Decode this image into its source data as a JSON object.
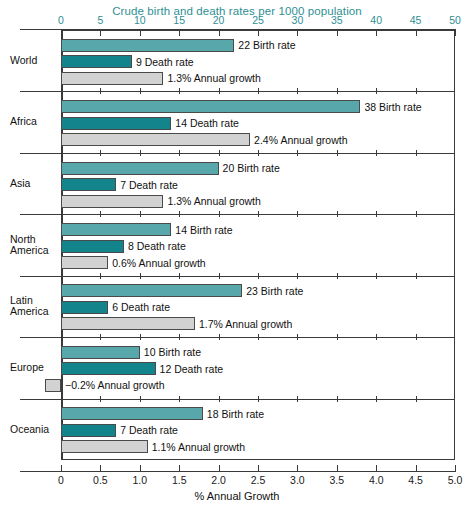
{
  "chart_data": {
    "type": "bar",
    "orientation": "horizontal",
    "title": "Crude birth and death rates per 1000 population",
    "xlabel_top": "Crude birth and death rates per 1000 population",
    "xlabel_bottom": "% Annual Growth",
    "ylabel": "",
    "grid": false,
    "legend_position": "inline-labels",
    "top_axis": {
      "label": "Crude birth and death rates per 1000 population",
      "min": 0,
      "max": 50,
      "step": 5,
      "ticks": [
        0,
        5,
        10,
        15,
        20,
        25,
        30,
        35,
        40,
        45,
        50
      ],
      "tick_labels": [
        "0",
        "5",
        "10",
        "15",
        "20",
        "25",
        "30",
        "35",
        "40",
        "45",
        "50"
      ],
      "color": "#2e8f94"
    },
    "bottom_axis": {
      "label": "% Annual Growth",
      "min": 0,
      "max": 5.0,
      "step": 0.5,
      "ticks": [
        0,
        0.5,
        1.0,
        1.5,
        2.0,
        2.5,
        3.0,
        3.5,
        4.0,
        4.5,
        5.0
      ],
      "tick_labels": [
        "0",
        "0.5",
        "1.0",
        "1.5",
        "2.0",
        "2.5",
        "3.0",
        "3.5",
        "4.0",
        "4.5",
        "5.0"
      ],
      "color": "#1a1a1a"
    },
    "categories": [
      "World",
      "Africa",
      "Asia",
      "North America",
      "Latin America",
      "Europe",
      "Oceania"
    ],
    "series": [
      {
        "name": "Birth rate",
        "axis": "top",
        "color": "#58a8ab",
        "values": [
          22,
          38,
          20,
          14,
          23,
          10,
          18
        ]
      },
      {
        "name": "Death rate",
        "axis": "top",
        "color": "#14848c",
        "values": [
          9,
          14,
          7,
          8,
          6,
          12,
          7
        ]
      },
      {
        "name": "Annual growth",
        "axis": "bottom",
        "color": "#d2d2d2",
        "values": [
          1.3,
          2.4,
          1.3,
          0.6,
          1.7,
          -0.2,
          1.1
        ]
      }
    ]
  },
  "groups": [
    {
      "label_lines": [
        "World"
      ],
      "bars": [
        {
          "label": "22 Birth rate",
          "value": 22,
          "axis": "top",
          "kind": "birth"
        },
        {
          "label": "9 Death rate",
          "value": 9,
          "axis": "top",
          "kind": "death"
        },
        {
          "label": "1.3% Annual growth",
          "value": 1.3,
          "axis": "bottom",
          "kind": "growth"
        }
      ]
    },
    {
      "label_lines": [
        "Africa"
      ],
      "bars": [
        {
          "label": "38 Birth rate",
          "value": 38,
          "axis": "top",
          "kind": "birth"
        },
        {
          "label": "14 Death rate",
          "value": 14,
          "axis": "top",
          "kind": "death"
        },
        {
          "label": "2.4% Annual growth",
          "value": 2.4,
          "axis": "bottom",
          "kind": "growth"
        }
      ]
    },
    {
      "label_lines": [
        "Asia"
      ],
      "bars": [
        {
          "label": "20 Birth rate",
          "value": 20,
          "axis": "top",
          "kind": "birth"
        },
        {
          "label": "7 Death rate",
          "value": 7,
          "axis": "top",
          "kind": "death"
        },
        {
          "label": "1.3% Annual growth",
          "value": 1.3,
          "axis": "bottom",
          "kind": "growth"
        }
      ]
    },
    {
      "label_lines": [
        "North",
        "America"
      ],
      "bars": [
        {
          "label": "14 Birth rate",
          "value": 14,
          "axis": "top",
          "kind": "birth"
        },
        {
          "label": "8 Death rate",
          "value": 8,
          "axis": "top",
          "kind": "death"
        },
        {
          "label": "0.6% Annual growth",
          "value": 0.6,
          "axis": "bottom",
          "kind": "growth"
        }
      ]
    },
    {
      "label_lines": [
        "Latin",
        "America"
      ],
      "bars": [
        {
          "label": "23 Birth rate",
          "value": 23,
          "axis": "top",
          "kind": "birth"
        },
        {
          "label": "6 Death rate",
          "value": 6,
          "axis": "top",
          "kind": "death"
        },
        {
          "label": "1.7% Annual growth",
          "value": 1.7,
          "axis": "bottom",
          "kind": "growth"
        }
      ]
    },
    {
      "label_lines": [
        "Europe"
      ],
      "bars": [
        {
          "label": "10 Birth rate",
          "value": 10,
          "axis": "top",
          "kind": "birth"
        },
        {
          "label": "12 Death rate",
          "value": 12,
          "axis": "top",
          "kind": "death"
        },
        {
          "label": "−0.2% Annual growth",
          "value": -0.2,
          "axis": "bottom",
          "kind": "growth"
        }
      ]
    },
    {
      "label_lines": [
        "Oceania"
      ],
      "bars": [
        {
          "label": "18 Birth rate",
          "value": 18,
          "axis": "top",
          "kind": "birth"
        },
        {
          "label": "7 Death rate",
          "value": 7,
          "axis": "top",
          "kind": "death"
        },
        {
          "label": "1.1% Annual growth",
          "value": 1.1,
          "axis": "bottom",
          "kind": "growth"
        }
      ]
    }
  ]
}
